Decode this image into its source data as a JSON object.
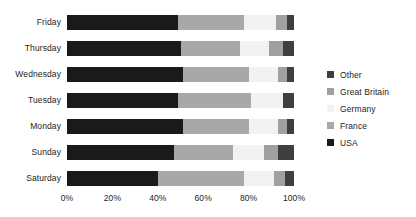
{
  "chart_data": {
    "type": "bar",
    "subtype": "horizontal-stacked-100-percent",
    "title": "",
    "xlabel": "",
    "ylabel": "",
    "xlim": [
      0,
      100
    ],
    "xticks": [
      "0%",
      "20%",
      "40%",
      "60%",
      "80%",
      "100%"
    ],
    "xtick_values": [
      0,
      20,
      40,
      60,
      80,
      100
    ],
    "grid": false,
    "legend_position": "right",
    "categories": [
      "Friday",
      "Thursday",
      "Wednesday",
      "Tuesday",
      "Monday",
      "Sunday",
      "Saturday"
    ],
    "stack_order": [
      "USA",
      "France",
      "Germany",
      "Great Britain",
      "Other"
    ],
    "legend_order": [
      "Other",
      "Great Britain",
      "Germany",
      "France",
      "USA"
    ],
    "series": [
      {
        "name": "USA",
        "color": "#1a1a1a",
        "values": [
          49,
          50,
          51,
          49,
          51,
          47,
          40
        ]
      },
      {
        "name": "France",
        "color": "#a8a8a8",
        "values": [
          29,
          26,
          29,
          32,
          29,
          26,
          38
        ]
      },
      {
        "name": "Germany",
        "color": "#f2f2f2",
        "values": [
          14,
          13,
          13,
          14,
          13,
          14,
          13
        ]
      },
      {
        "name": "Great Britain",
        "color": "#a0a0a0",
        "values": [
          5,
          6,
          4,
          0,
          4,
          6,
          5
        ]
      },
      {
        "name": "Other",
        "color": "#3f3f3f",
        "values": [
          3,
          5,
          3,
          5,
          3,
          7,
          4
        ]
      }
    ]
  },
  "legend": {
    "items": [
      {
        "label": "Other",
        "color": "#3f3f3f"
      },
      {
        "label": "Great Britain",
        "color": "#a0a0a0"
      },
      {
        "label": "Germany",
        "color": "#f2f2f2"
      },
      {
        "label": "France",
        "color": "#a8a8a8"
      },
      {
        "label": "USA",
        "color": "#1a1a1a"
      }
    ]
  }
}
